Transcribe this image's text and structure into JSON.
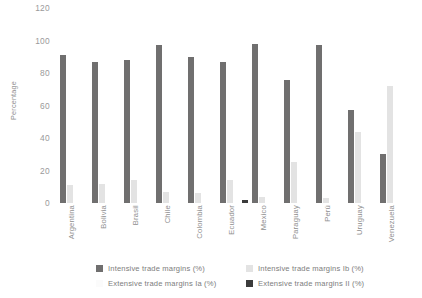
{
  "chart_data": {
    "type": "bar",
    "title": "",
    "xlabel": "",
    "ylabel": "Percentage",
    "ylim": [
      0,
      120
    ],
    "yticks": [
      0,
      20,
      40,
      60,
      80,
      100,
      120
    ],
    "grid": false,
    "legend_position": "bottom",
    "categories": [
      "Argentina",
      "Bolivia",
      "Brasil",
      "Chile",
      "Colombia",
      "Ecuador",
      "Mexico",
      "Paraguay",
      "Perú",
      "Uruguay",
      "Venezuela"
    ],
    "series": [
      {
        "name": "Intensive trade margins (%)",
        "color": "#706f6f",
        "values": [
          91,
          87,
          88,
          97,
          90,
          87,
          98,
          76,
          97,
          57,
          30
        ]
      },
      {
        "name": "Intensive trade margins Ib (%)",
        "color": "#e3e3e3",
        "values": [
          11,
          12,
          14,
          7,
          6,
          14,
          4,
          25,
          3,
          44,
          72
        ]
      },
      {
        "name": "Extensive trade margins Ia (%)",
        "color": "#fafafa",
        "values": [
          0,
          0,
          0,
          0,
          0,
          0,
          0,
          0,
          0,
          0,
          0
        ]
      },
      {
        "name": "Extensive trade margins II (%)",
        "color": "#3b3b3b",
        "values": [
          0,
          0,
          0,
          0,
          0,
          2,
          0,
          0,
          0,
          0,
          0
        ]
      }
    ]
  },
  "legend": {
    "items": [
      {
        "label": "Intensive trade margins (%)",
        "swatch_color": "#706f6f",
        "icon": "legend-swatch-icon"
      },
      {
        "label": "Intensive trade margins Ib (%)",
        "swatch_color": "#e3e3e3",
        "icon": "legend-swatch-icon"
      },
      {
        "label": "Extensive trade margins Ia (%)",
        "swatch_color": "#fbfbfb",
        "icon": "legend-swatch-icon"
      },
      {
        "label": "Extensive trade margins II (%)",
        "swatch_color": "#3b3b3b",
        "icon": "legend-swatch-icon"
      }
    ]
  }
}
